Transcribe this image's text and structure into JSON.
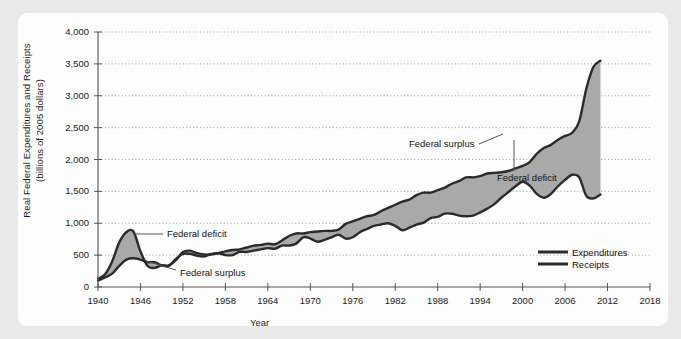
{
  "chart_data": {
    "type": "area",
    "title": "",
    "xlabel": "Year",
    "ylabel": "Real Federal Expenditures and Receipts (billions of 2005 dollars)",
    "ylabel_line1": "Real Federal Expenditures and Receipts",
    "ylabel_line2": "(billions of 2005 dollars)",
    "xlim": [
      1940,
      2018
    ],
    "ylim": [
      0,
      4000
    ],
    "grid": true,
    "legend_position": "bottom-right",
    "ytick_labels": [
      "0",
      "500",
      "1,000",
      "1,500",
      "2,000",
      "2,500",
      "3,000",
      "3,500",
      "4,000"
    ],
    "ytick_values": [
      0,
      500,
      1000,
      1500,
      2000,
      2500,
      3000,
      3500,
      4000
    ],
    "xtick_labels": [
      "1940",
      "1946",
      "1952",
      "1958",
      "1964",
      "1970",
      "1976",
      "1982",
      "1988",
      "1994",
      "2000",
      "2006",
      "2012",
      "2018"
    ],
    "xtick_values": [
      1940,
      1946,
      1952,
      1958,
      1964,
      1970,
      1976,
      1982,
      1988,
      1994,
      2000,
      2006,
      2012,
      2018
    ],
    "x": [
      1940,
      1941,
      1942,
      1943,
      1944,
      1945,
      1946,
      1947,
      1948,
      1949,
      1950,
      1951,
      1952,
      1953,
      1954,
      1955,
      1956,
      1957,
      1958,
      1959,
      1960,
      1961,
      1962,
      1963,
      1964,
      1965,
      1966,
      1967,
      1968,
      1969,
      1970,
      1971,
      1972,
      1973,
      1974,
      1975,
      1976,
      1977,
      1978,
      1979,
      1980,
      1981,
      1982,
      1983,
      1984,
      1985,
      1986,
      1987,
      1988,
      1989,
      1990,
      1991,
      1992,
      1993,
      1994,
      1995,
      1996,
      1997,
      1998,
      1999,
      2000,
      2001,
      2002,
      2003,
      2004,
      2005,
      2006,
      2007,
      2008,
      2009,
      2010,
      2011
    ],
    "series": [
      {
        "name": "Expenditures",
        "color": "#2b2b2b",
        "values": [
          130,
          200,
          400,
          700,
          860,
          870,
          560,
          330,
          300,
          340,
          340,
          420,
          550,
          570,
          530,
          510,
          510,
          530,
          560,
          580,
          590,
          620,
          650,
          660,
          680,
          670,
          730,
          800,
          840,
          840,
          860,
          870,
          880,
          880,
          900,
          990,
          1030,
          1070,
          1110,
          1130,
          1190,
          1240,
          1290,
          1340,
          1370,
          1440,
          1480,
          1480,
          1520,
          1560,
          1620,
          1660,
          1720,
          1720,
          1740,
          1780,
          1790,
          1800,
          1820,
          1860,
          1900,
          1960,
          2090,
          2180,
          2230,
          2310,
          2370,
          2420,
          2600,
          3110,
          3450,
          3550
        ]
      },
      {
        "name": "Receipts",
        "color": "#2b2b2b",
        "values": [
          100,
          150,
          210,
          330,
          430,
          450,
          430,
          390,
          390,
          340,
          330,
          440,
          520,
          520,
          490,
          480,
          520,
          530,
          500,
          500,
          550,
          550,
          570,
          590,
          610,
          600,
          650,
          650,
          680,
          780,
          760,
          710,
          740,
          780,
          820,
          760,
          780,
          860,
          910,
          960,
          980,
          1000,
          960,
          890,
          930,
          980,
          1010,
          1080,
          1100,
          1150,
          1150,
          1120,
          1110,
          1120,
          1170,
          1230,
          1300,
          1400,
          1490,
          1580,
          1650,
          1590,
          1460,
          1400,
          1460,
          1580,
          1680,
          1760,
          1720,
          1430,
          1390,
          1450
        ]
      }
    ],
    "annotations": [
      {
        "label": "Federal deficit",
        "id": "deficit-early",
        "x": 1947,
        "y": 740
      },
      {
        "label": "Federal surplus",
        "id": "surplus-early",
        "x": 1962,
        "y": 260
      },
      {
        "label": "Federal surplus",
        "id": "surplus-late",
        "x": 1985,
        "y": 2150
      },
      {
        "label": "Federal deficit",
        "id": "deficit-late",
        "x": 1996,
        "y": 1620
      }
    ]
  },
  "legend": {
    "items": [
      {
        "label": "Expenditures",
        "color": "#2b2b2b"
      },
      {
        "label": "Receipts",
        "color": "#2b2b2b"
      }
    ]
  },
  "colors": {
    "fill": "#a9a9a9",
    "line": "#2b2b2b",
    "grid": "#9a9a9a",
    "axis": "#555555",
    "panel_bg": "#fdfdfd",
    "page_bg": "#e9e9e9"
  }
}
